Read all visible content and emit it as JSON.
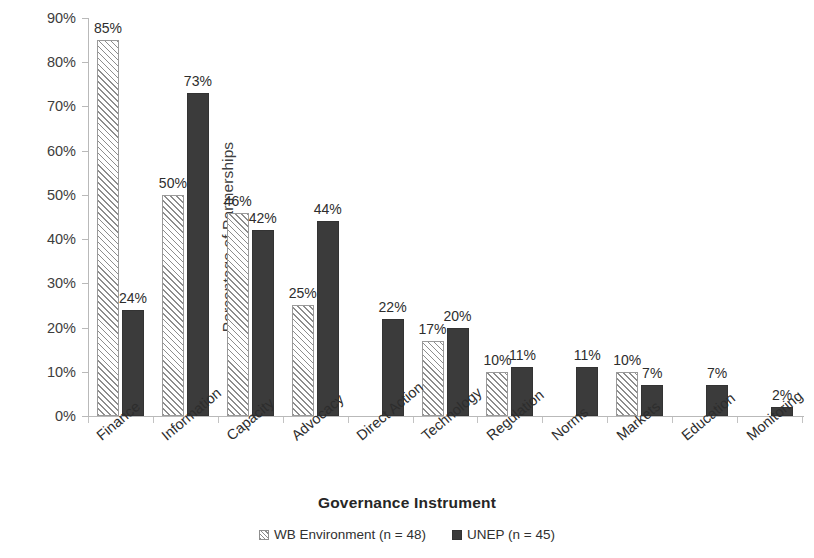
{
  "chart_data": {
    "type": "bar",
    "title": "",
    "xlabel": "Governance Instrument",
    "ylabel": "Percentage of Partnerships",
    "ylim": [
      0,
      90
    ],
    "ytick_labels": [
      "0%",
      "10%",
      "20%",
      "30%",
      "40%",
      "50%",
      "60%",
      "70%",
      "80%",
      "90%"
    ],
    "ytick_values": [
      0,
      10,
      20,
      30,
      40,
      50,
      60,
      70,
      80,
      90
    ],
    "grid": false,
    "legend_position": "bottom",
    "categories": [
      "Finance",
      "Information",
      "Capacity",
      "Advocacy",
      "Direct Action",
      "Technology",
      "Regulation",
      "Norms",
      "Markets",
      "Education",
      "Monitoring"
    ],
    "series": [
      {
        "name": "WB Environment (n = 48)",
        "fill": "diagonal-hatch",
        "color": "#8d8d8d",
        "values": [
          85,
          50,
          46,
          25,
          null,
          17,
          10,
          null,
          10,
          null,
          null
        ],
        "labels": [
          "85%",
          "50%",
          "46%",
          "25%",
          "",
          "17%",
          "10%",
          "",
          "10%",
          "",
          ""
        ]
      },
      {
        "name": "UNEP (n = 45)",
        "fill": "solid",
        "color": "#3b3b3b",
        "values": [
          24,
          73,
          42,
          44,
          22,
          20,
          11,
          11,
          7,
          7,
          2
        ],
        "labels": [
          "24%",
          "73%",
          "42%",
          "44%",
          "22%",
          "20%",
          "11%",
          "11%",
          "7%",
          "7%",
          "2%"
        ]
      }
    ]
  },
  "legend": {
    "items": [
      {
        "label": "WB Environment (n = 48)",
        "swatch": "hatched-square-icon"
      },
      {
        "label": "UNEP (n = 45)",
        "swatch": "filled-square-icon"
      }
    ]
  }
}
